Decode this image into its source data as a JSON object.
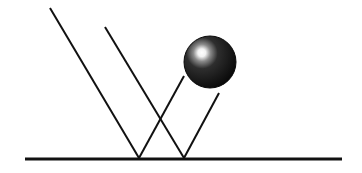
{
  "diagram": {
    "canvas": {
      "width": 362,
      "height": 173,
      "background": "#ffffff"
    },
    "colors": {
      "line": "#111111",
      "sphere_dark": "#0a0a0a",
      "sphere_mid": "#2a2a2a",
      "sphere_highlight": "#ffffff"
    },
    "ground": {
      "x1": 25,
      "y1": 159,
      "x2": 342,
      "y2": 159,
      "stroke_width": 3
    },
    "incident_rays": [
      {
        "x1": 50,
        "y1": 8,
        "x2": 139,
        "y2": 158
      },
      {
        "x1": 105,
        "y1": 27,
        "x2": 184,
        "y2": 158
      }
    ],
    "reflected_rays": [
      {
        "x1": 139,
        "y1": 158,
        "x2": 184,
        "y2": 76
      },
      {
        "x1": 184,
        "y1": 158,
        "x2": 219,
        "y2": 93
      }
    ],
    "sphere": {
      "cx": 210,
      "cy": 62,
      "r": 26,
      "highlight_cx": 203,
      "highlight_cy": 55
    }
  }
}
